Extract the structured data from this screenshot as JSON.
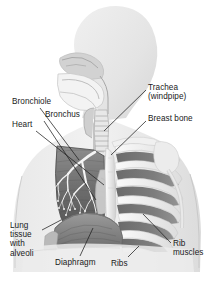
{
  "figure": {
    "background_color": "#ffffff",
    "ink_color": "#1a1a1a",
    "width": 217,
    "height": 283
  },
  "labels": [
    {
      "id": "bronchiole",
      "text": "Bronchiole",
      "lines": [
        "Bronchiole"
      ],
      "x": 12,
      "y": 97,
      "leader": {
        "x1": 40,
        "y1": 108,
        "x2": 79,
        "y2": 160
      }
    },
    {
      "id": "bronchus",
      "text": "Bronchus",
      "lines": [
        "Bronchus"
      ],
      "x": 45,
      "y": 110,
      "leader": {
        "x1": 44,
        "y1": 121,
        "x2": 96,
        "y2": 200
      }
    },
    {
      "id": "heart",
      "text": "Heart",
      "lines": [
        "Heart"
      ],
      "x": 12,
      "y": 120,
      "leader": {
        "x1": 36,
        "y1": 131,
        "x2": 104,
        "y2": 185
      }
    },
    {
      "id": "trachea",
      "text": "Trachea (windpipe)",
      "lines": [
        "Trachea",
        "(windpipe)"
      ],
      "x": 148,
      "y": 83,
      "leader": {
        "x1": 146,
        "y1": 90,
        "x2": 104,
        "y2": 131
      }
    },
    {
      "id": "breast-bone",
      "text": "Breast bone",
      "lines": [
        "Breast bone"
      ],
      "x": 148,
      "y": 114,
      "leader": {
        "x1": 146,
        "y1": 121,
        "x2": 111,
        "y2": 155
      }
    },
    {
      "id": "lung-tissue-with-alveoli",
      "text": "Lung tissue with alveoli",
      "lines": [
        "Lung",
        "tissue",
        "with",
        "alveoli"
      ],
      "x": 10,
      "y": 221,
      "leader": {
        "x1": 42,
        "y1": 230,
        "x2": 61,
        "y2": 220
      }
    },
    {
      "id": "diaphragm",
      "text": "Diaphragm",
      "lines": [
        "Diaphragm"
      ],
      "x": 55,
      "y": 258,
      "leader": {
        "x1": 80,
        "y1": 256,
        "x2": 93,
        "y2": 228
      }
    },
    {
      "id": "ribs",
      "text": "Ribs",
      "lines": [
        "Ribs"
      ],
      "x": 111,
      "y": 259,
      "leader": {
        "x1": 128,
        "y1": 257,
        "x2": 139,
        "y2": 246
      }
    },
    {
      "id": "rib-muscles",
      "text": "Rib muscles",
      "lines": [
        "Rib",
        "muscles"
      ],
      "x": 173,
      "y": 239,
      "leader": {
        "x1": 171,
        "y1": 243,
        "x2": 143,
        "y2": 214
      }
    }
  ],
  "anatomy_parts": [
    "head-silhouette",
    "nasal-cavity",
    "mouth-cavity",
    "tongue",
    "pharynx",
    "larynx",
    "trachea",
    "bronchial-tree",
    "left-lung-cutaway",
    "heart",
    "sternum",
    "rib-cage",
    "intercostal-muscles",
    "diaphragm",
    "shoulder-joint",
    "humerus",
    "clavicle",
    "torso-silhouette"
  ]
}
